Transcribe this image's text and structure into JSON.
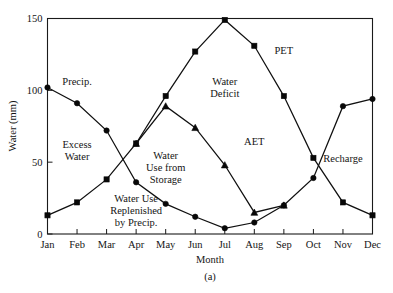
{
  "figure": {
    "caption": "(a)",
    "background_color": "#ffffff",
    "ink_color": "#111111"
  },
  "chart_data": {
    "type": "line",
    "title": "",
    "subtitle": "",
    "xlabel": "Month",
    "ylabel": "Water (mm)",
    "categories": [
      "Jan",
      "Feb",
      "Mar",
      "Apr",
      "May",
      "Jun",
      "Jul",
      "Aug",
      "Sep",
      "Oct",
      "Nov",
      "Dec"
    ],
    "xlim": [
      0,
      11
    ],
    "ylim": [
      0,
      150
    ],
    "yticks": [
      0,
      50,
      100,
      150
    ],
    "yticklabels": [
      "0",
      "50",
      "100",
      "150"
    ],
    "grid": false,
    "legend": "none",
    "series": [
      {
        "name": "Precip.",
        "marker": "circle",
        "x": [
          "Jan",
          "Feb",
          "Mar",
          "Apr",
          "May",
          "Jun",
          "Jul",
          "Aug",
          "Sep",
          "Oct",
          "Nov",
          "Dec"
        ],
        "values": [
          102,
          91,
          72,
          36,
          21,
          12,
          4,
          8,
          20,
          39,
          89,
          94
        ]
      },
      {
        "name": "PET",
        "marker": "square",
        "x": [
          "Jan",
          "Feb",
          "Mar",
          "Apr",
          "May",
          "Jun",
          "Jul",
          "Aug",
          "Sep",
          "Oct",
          "Nov",
          "Dec"
        ],
        "values": [
          13,
          22,
          38,
          63,
          96,
          127,
          149,
          131,
          96,
          53,
          22,
          13
        ]
      },
      {
        "name": "AET",
        "marker": "triangle",
        "x": [
          "Apr",
          "May",
          "Jun",
          "Jul",
          "Aug",
          "Sep"
        ],
        "values": [
          63,
          89,
          74,
          48,
          15,
          20
        ]
      }
    ],
    "annotations": [
      {
        "text": "Precip.",
        "x_month": "Feb",
        "y_value": 104,
        "lines": [
          "Precip."
        ]
      },
      {
        "text": "Excess Water",
        "x_month": "Feb",
        "y_value": 60,
        "lines": [
          "Excess",
          "Water"
        ]
      },
      {
        "text": "Water Use Replenished by Precip.",
        "x_month": "Apr",
        "y_value": 22,
        "lines": [
          "Water Use",
          "Replenished",
          "by Precip."
        ]
      },
      {
        "text": "Water Use from Storage",
        "x_month": "May",
        "y_value": 52,
        "lines": [
          "Water",
          "Use from",
          "Storage"
        ]
      },
      {
        "text": "Water Deficit",
        "x_month": "Jul",
        "y_value": 104,
        "lines": [
          "Water",
          "Deficit"
        ]
      },
      {
        "text": "PET",
        "x_month": "Sep",
        "y_value": 125,
        "lines": [
          "PET"
        ]
      },
      {
        "text": "AET",
        "x_month": "Aug",
        "y_value": 62,
        "lines": [
          "AET"
        ]
      },
      {
        "text": "Recharge",
        "x_month": "Nov",
        "y_value": 50,
        "lines": [
          "Recharge"
        ]
      }
    ]
  }
}
